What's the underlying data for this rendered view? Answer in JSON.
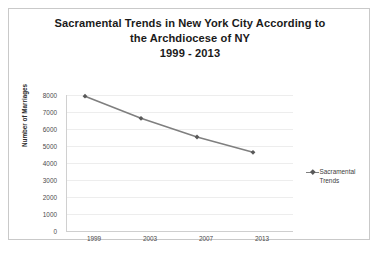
{
  "chart_data": {
    "type": "line",
    "title": "Sacramental Trends in New York City According to the Archdiocese of NY 1999 - 2013",
    "title_lines": [
      "Sacramental Trends in New York City According to",
      "the Archdiocese of NY",
      "1999 - 2013"
    ],
    "xlabel": "",
    "ylabel": "Number of Marriages",
    "categories": [
      "1999",
      "2003",
      "2007",
      "2013"
    ],
    "series": [
      {
        "name": "Sacramental Trends",
        "values": [
          7400,
          6100,
          5000,
          4100
        ],
        "color": "#7f7f7f",
        "marker_color": "#595959",
        "marker": "diamond"
      }
    ],
    "ylim": [
      0,
      8000
    ],
    "yticks": [
      8000,
      7000,
      6000,
      5000,
      4000,
      3000,
      2000,
      1000,
      0
    ],
    "ytick_labels": [
      "8000",
      "7000",
      "6000",
      "5000",
      "4000",
      "3000",
      "2000",
      "1000",
      "0"
    ],
    "grid": true,
    "grid_axis": "y",
    "legend": {
      "position": "right",
      "entries": [
        {
          "label": "Sacramental Trends",
          "label_lines": [
            "Sacramental",
            "Trends"
          ]
        }
      ]
    },
    "colors": {
      "background": "#ffffff",
      "frame_border": "#c9c9c9",
      "gridline": "#ededed",
      "axis_line": "#d0d0d0",
      "title_text": "#1a1a1a",
      "tick_text": "#4a4a4a",
      "axis_title_text": "#2b2b2b"
    }
  }
}
